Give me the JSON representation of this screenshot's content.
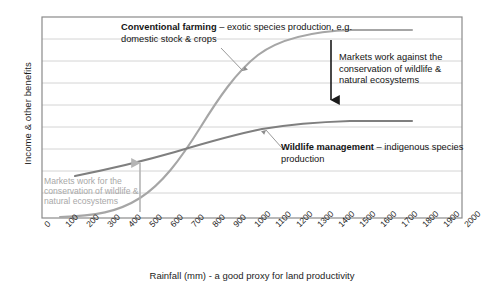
{
  "chart_data": {
    "type": "line",
    "title": "",
    "xlabel": "Rainfall (mm) - a good proxy for land productivity",
    "ylabel": "Income & other benefits",
    "xlim": [
      0,
      2000
    ],
    "ylim": [
      0,
      100
    ],
    "grid": true,
    "legend_position": "inline-annotations",
    "x_tick_labels": [
      "0",
      "100",
      "200",
      "300",
      "400",
      "500",
      "600",
      "700",
      "800",
      "900",
      "1000",
      "1100",
      "1200",
      "1300",
      "1400",
      "1500",
      "1600",
      "1700",
      "1800",
      "1900",
      "2000"
    ],
    "y_tick_labels": [],
    "series": [
      {
        "name": "Conventional farming",
        "color": "#a6a6a6",
        "x": [
          100,
          200,
          300,
          400,
          500,
          600,
          700,
          800,
          900,
          1000,
          1100,
          1200,
          1300,
          1400,
          1500,
          1600,
          1700,
          1800
        ],
        "values": [
          1,
          3,
          6,
          11,
          18,
          27,
          39,
          52,
          64,
          74,
          82,
          88,
          91,
          93,
          94,
          95,
          95,
          95
        ]
      },
      {
        "name": "Wildlife management",
        "color": "#7f7f7f",
        "x": [
          100,
          200,
          300,
          400,
          500,
          600,
          700,
          800,
          900,
          1000,
          1100,
          1200,
          1300,
          1400,
          1500,
          1600,
          1700,
          1800
        ],
        "values": [
          21,
          26,
          31,
          36,
          41,
          45,
          49,
          52,
          54,
          56,
          57,
          58,
          58,
          59,
          59,
          59,
          59,
          59
        ]
      }
    ],
    "annotations": [
      {
        "name": "conventional-farming-label",
        "bold_text": "Conventional farming",
        "rest_text": " – exotic species production, e.g. domestic stock & crops",
        "color": "#141414"
      },
      {
        "name": "wildlife-management-label",
        "bold_text": "Wildlife management",
        "rest_text": " – indigenous species production",
        "color": "#141414"
      },
      {
        "name": "markets-against-note",
        "text": "Markets work against the conservation of wildlife & natural ecosystems",
        "color": "#141414"
      },
      {
        "name": "markets-for-note",
        "text": "Markets work for the conservation of wildlife & natural ecosystems",
        "color": "#a8a8a8"
      }
    ]
  },
  "axes": {
    "y_title": "Income & other benefits",
    "x_title": "Rainfall (mm) - a good proxy for land productivity"
  },
  "labels": {
    "conventional_bold": "Conventional farming",
    "conventional_rest": " – exotic species production, e.g. domestic stock & crops",
    "wildlife_bold": "Wildlife management",
    "wildlife_rest": " – indigenous species production",
    "markets_against": "Markets work against the conservation of wildlife & natural ecosystems",
    "markets_for": "Markets work for the conservation of wildlife & natural ecosystems"
  },
  "colors": {
    "conventional_line": "#a6a6a6",
    "wildlife_line": "#7f7f7f",
    "grid": "#c9c9c9",
    "frame": "#8a8a8a",
    "arrow_black": "#1a1a1a",
    "arrow_grey": "#b5b5b5"
  }
}
